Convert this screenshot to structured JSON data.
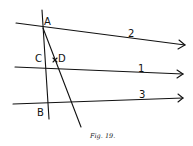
{
  "figure": {
    "caption": "Fig. 19.",
    "points": {
      "A": "A",
      "B": "B",
      "C": "C",
      "D": "D"
    },
    "lines": [
      {
        "id": "2",
        "label": "2"
      },
      {
        "id": "1",
        "label": "1"
      },
      {
        "id": "3",
        "label": "3"
      }
    ],
    "stroke_color": "#111111",
    "background": "#ffffff"
  }
}
